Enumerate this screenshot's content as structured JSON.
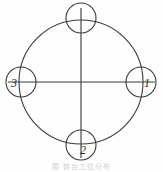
{
  "figure": {
    "caption": "图 转台工位分布",
    "background_color": "#fefefe",
    "stroke_color": "#3a3a3a",
    "label_color": "#2b2b2b"
  },
  "diagram": {
    "type": "rotary-table-station-layout",
    "main_circle": {
      "center_x": 81,
      "center_y": 82,
      "radius": 62
    },
    "axes": {
      "horizontal": {
        "x1": 8,
        "y1": 82,
        "x2": 155,
        "y2": 82
      },
      "vertical": {
        "x1": 81,
        "y1": 8,
        "x2": 81,
        "y2": 158
      }
    },
    "station_radius": 15,
    "stations": [
      {
        "name": "station-top",
        "label": "",
        "cx": 81,
        "cy": 18,
        "position": "top"
      },
      {
        "name": "station-right",
        "label": "1",
        "cx": 141,
        "cy": 82,
        "position": "right"
      },
      {
        "name": "station-bottom",
        "label": "2",
        "cx": 81,
        "cy": 145,
        "position": "bottom"
      },
      {
        "name": "station-left",
        "label": "3",
        "cx": 21,
        "cy": 82,
        "position": "left"
      }
    ]
  }
}
